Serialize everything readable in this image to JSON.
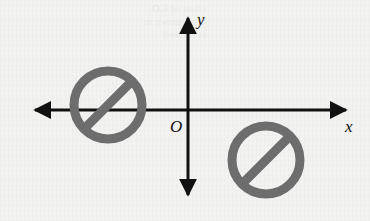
{
  "figure": {
    "background_color": "#f2f2f0",
    "ghost_text": "ction of CD.\nd as shown in\nis rotated",
    "width": 370,
    "height": 221
  },
  "axes": {
    "color": "#111111",
    "stroke_width": 3,
    "origin_label": "O",
    "x_axis": {
      "name": "x-axis",
      "label": "x",
      "y": 110,
      "x_start": 29,
      "x_end": 352,
      "arrow_left": true,
      "arrow_right": true,
      "label_x": 345,
      "label_y": 132
    },
    "y_axis": {
      "name": "y-axis",
      "label": "y",
      "x": 188,
      "y_start": 12,
      "y_end": 201,
      "arrow_up": true,
      "arrow_down": true,
      "label_x": 200,
      "label_y": 24
    },
    "origin": {
      "x": 188,
      "y": 110,
      "label_x": 176,
      "label_y": 130
    }
  },
  "shapes": {
    "color": "#6d6d6d",
    "stroke_width": 9,
    "items": [
      {
        "name": "prohibition-symbol-left",
        "quadrant": "second-third (straddling x-axis, left of y-axis)",
        "center_x": 108,
        "center_y": 105,
        "radius": 34,
        "slash_angle_deg": -45,
        "slash_direction": "lower-left to upper-right"
      },
      {
        "name": "prohibition-symbol-right",
        "quadrant": "fourth (below x-axis, right of y-axis)",
        "center_x": 266,
        "center_y": 160,
        "radius": 34,
        "slash_angle_deg": -45,
        "slash_direction": "lower-left to upper-right"
      }
    ]
  }
}
